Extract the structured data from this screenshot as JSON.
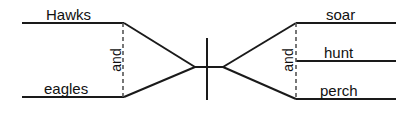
{
  "diagram": {
    "type": "sentence-diagram",
    "style": "reed-kellogg",
    "colors": {
      "background": "#ffffff",
      "line": "#1a1a1a",
      "dashed_line": "#555555",
      "text": "#111111"
    },
    "subject": {
      "conjunction": "and",
      "terms": [
        {
          "text": "Hawks",
          "position": "upper-left"
        },
        {
          "text": "eagles",
          "position": "lower-left"
        }
      ]
    },
    "predicate": {
      "conjunction": "and",
      "terms": [
        {
          "text": "soar",
          "position": "upper-right"
        },
        {
          "text": "hunt",
          "position": "middle-right"
        },
        {
          "text": "perch",
          "position": "lower-right"
        }
      ]
    },
    "divider": {
      "name": "subject-predicate-divider",
      "orientation": "vertical"
    }
  }
}
